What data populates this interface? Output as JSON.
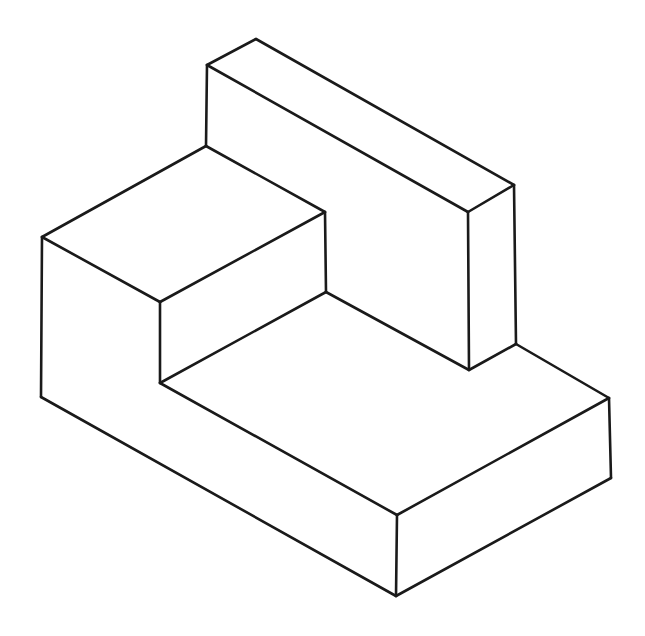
{
  "diagram": {
    "type": "isometric-line-drawing",
    "stroke_color": "#1a1a1a",
    "background": "#ffffff",
    "vertices": {
      "A": [
        256,
        39
      ],
      "B": [
        207,
        65
      ],
      "C": [
        514,
        185
      ],
      "D": [
        468,
        212
      ],
      "E": [
        469,
        370
      ],
      "F": [
        516,
        344
      ],
      "G": [
        609,
        398
      ],
      "H": [
        611,
        478
      ],
      "I": [
        397,
        515
      ],
      "J": [
        396,
        596
      ],
      "K": [
        42,
        237
      ],
      "L": [
        41,
        397
      ],
      "M": [
        160,
        302
      ],
      "N": [
        160,
        383
      ],
      "O": [
        325,
        212
      ],
      "P": [
        326,
        292
      ],
      "Q": [
        206,
        146
      ]
    },
    "edges": [
      [
        "A",
        "B"
      ],
      [
        "A",
        "C"
      ],
      [
        "B",
        "D"
      ],
      [
        "C",
        "D"
      ],
      [
        "B",
        "Q"
      ],
      [
        "D",
        "E"
      ],
      [
        "C",
        "F"
      ],
      [
        "E",
        "F"
      ],
      [
        "F",
        "G"
      ],
      [
        "G",
        "H"
      ],
      [
        "G",
        "I"
      ],
      [
        "I",
        "J"
      ],
      [
        "H",
        "J"
      ],
      [
        "I",
        "N"
      ],
      [
        "L",
        "J"
      ],
      [
        "K",
        "L"
      ],
      [
        "K",
        "Q"
      ],
      [
        "K",
        "M"
      ],
      [
        "M",
        "O"
      ],
      [
        "Q",
        "O"
      ],
      [
        "M",
        "N"
      ],
      [
        "O",
        "P"
      ],
      [
        "N",
        "P"
      ],
      [
        "P",
        "E"
      ]
    ]
  }
}
